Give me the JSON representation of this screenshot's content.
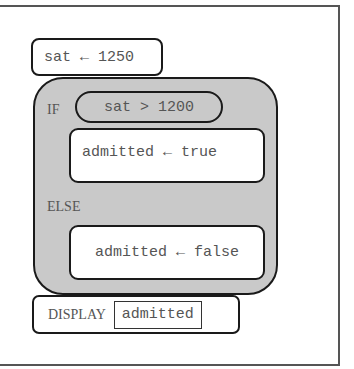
{
  "diagram": {
    "assignment_top": {
      "variable": "sat",
      "arrow": "←",
      "value": "1250",
      "text": "sat ← 1250"
    },
    "if_block": {
      "if_label": "IF",
      "condition": "sat > 1200",
      "then_statement": "admitted ← true",
      "else_label": "ELSE",
      "else_statement": "admitted ← false"
    },
    "display_block": {
      "keyword": "DISPLAY",
      "argument": "admitted"
    }
  },
  "colors": {
    "block_fill": "#c9c9c9",
    "border": "#1a1a1a",
    "text": "#555555",
    "background": "#ffffff"
  }
}
